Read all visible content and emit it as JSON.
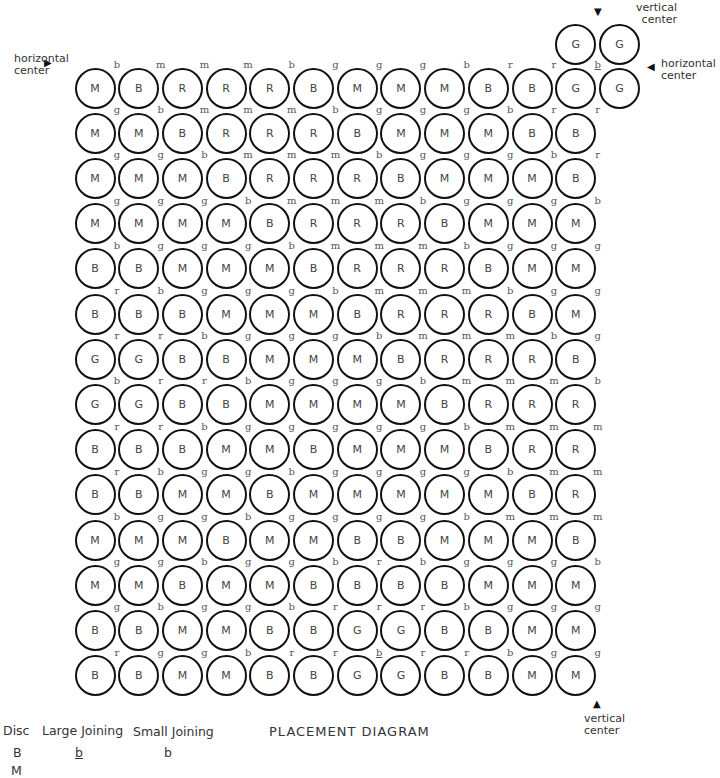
{
  "diagram": {
    "title": "PLACEMENT DIAGRAM",
    "grid_columns": 12,
    "grid_rows": 14,
    "discs": [
      [
        "M",
        "B",
        "R",
        "R",
        "R",
        "B",
        "M",
        "M",
        "M",
        "B",
        "B",
        "G",
        "G"
      ],
      [
        "M",
        "M",
        "B",
        "R",
        "R",
        "R",
        "B",
        "M",
        "M",
        "M",
        "B",
        "B"
      ],
      [
        "M",
        "M",
        "M",
        "B",
        "R",
        "R",
        "R",
        "B",
        "M",
        "M",
        "M",
        "B"
      ],
      [
        "M",
        "M",
        "M",
        "M",
        "B",
        "R",
        "R",
        "R",
        "B",
        "M",
        "M",
        "M"
      ],
      [
        "B",
        "B",
        "M",
        "M",
        "M",
        "B",
        "R",
        "R",
        "R",
        "B",
        "M",
        "M"
      ],
      [
        "B",
        "B",
        "B",
        "M",
        "M",
        "M",
        "B",
        "R",
        "R",
        "R",
        "B",
        "M"
      ],
      [
        "G",
        "G",
        "B",
        "B",
        "M",
        "M",
        "M",
        "B",
        "R",
        "R",
        "R",
        "B"
      ],
      [
        "G",
        "G",
        "B",
        "B",
        "M",
        "M",
        "M",
        "M",
        "B",
        "R",
        "R",
        "R"
      ],
      [
        "B",
        "B",
        "B",
        "M",
        "M",
        "B",
        "M",
        "M",
        "M",
        "B",
        "R",
        "R"
      ],
      [
        "B",
        "B",
        "M",
        "M",
        "B",
        "M",
        "M",
        "M",
        "M",
        "M",
        "B",
        "R"
      ],
      [
        "M",
        "M",
        "M",
        "B",
        "M",
        "M",
        "B",
        "B",
        "M",
        "M",
        "M",
        "B"
      ],
      [
        "M",
        "M",
        "B",
        "M",
        "M",
        "B",
        "B",
        "B",
        "B",
        "M",
        "M",
        "M"
      ],
      [
        "B",
        "B",
        "M",
        "M",
        "B",
        "B",
        "G",
        "G",
        "B",
        "B",
        "M",
        "M"
      ],
      [
        "B",
        "B",
        "M",
        "M",
        "B",
        "B",
        "G",
        "G",
        "B",
        "B",
        "M",
        "M"
      ]
    ],
    "extra_top_discs": [
      "G",
      "G"
    ],
    "joinings": [
      [
        "b",
        "m",
        "m",
        "m",
        "b",
        "g",
        "g",
        "g",
        "b",
        "r",
        "r",
        "b_"
      ],
      [
        "g",
        "b",
        "m",
        "m",
        "m",
        "b",
        "g",
        "g",
        "g",
        "b",
        "r",
        "r"
      ],
      [
        "g",
        "g",
        "b",
        "m",
        "m",
        "m",
        "b",
        "g",
        "g",
        "g",
        "b",
        "r"
      ],
      [
        "g",
        "g",
        "g",
        "b",
        "m",
        "m",
        "m",
        "b",
        "g",
        "g",
        "g",
        "b"
      ],
      [
        "b",
        "g",
        "g",
        "g",
        "b",
        "m",
        "m",
        "m",
        "b",
        "g",
        "g",
        "g"
      ],
      [
        "r",
        "b",
        "g",
        "g",
        "g",
        "b",
        "m",
        "m",
        "m",
        "b",
        "g",
        "g"
      ],
      [
        "r",
        "r",
        "b",
        "g",
        "g",
        "g",
        "b",
        "m",
        "m",
        "m",
        "b",
        "g"
      ],
      [
        "b",
        "r",
        "r",
        "b",
        "g",
        "g",
        "g",
        "b",
        "m",
        "m",
        "m",
        "b"
      ],
      [
        "r",
        "r",
        "b",
        "g",
        "g",
        "g",
        "g",
        "g",
        "b",
        "m",
        "m",
        "m"
      ],
      [
        "r",
        "b",
        "g",
        "g",
        "b",
        "g",
        "g",
        "g",
        "g",
        "b",
        "m",
        "m"
      ],
      [
        "b",
        "g",
        "g",
        "b",
        "g",
        "g",
        "g",
        "g",
        "b",
        "m",
        "m",
        "m"
      ],
      [
        "g",
        "g",
        "b",
        "g",
        "g",
        "b",
        "r",
        "b",
        "g",
        "g",
        "g",
        "b"
      ],
      [
        "g",
        "b",
        "g",
        "g",
        "b",
        "r",
        "r",
        "r",
        "b",
        "g",
        "g",
        "g"
      ],
      [
        "r",
        "g",
        "g",
        "b",
        "r",
        "r",
        "b_",
        "r",
        "r",
        "b",
        "g",
        "g"
      ]
    ],
    "markers": {
      "left_horizontal": "horizontal center",
      "top_vertical": "vertical center",
      "right_horizontal": "horizontal center",
      "bottom_vertical": "vertical center"
    },
    "legend": {
      "headers": [
        "Disc",
        "Large Joining",
        "Small Joining"
      ],
      "rows": [
        {
          "disc": "B",
          "large": "b",
          "small": "b"
        },
        {
          "disc": "M",
          "large": "",
          "small": ""
        }
      ]
    }
  }
}
